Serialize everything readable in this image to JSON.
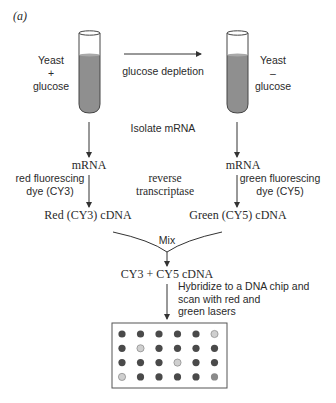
{
  "figure": {
    "panel_label": "(a)",
    "left_culture": {
      "line1": "Yeast",
      "line2": "+",
      "line3": "glucose"
    },
    "right_culture": {
      "line1": "Yeast",
      "line2": "–",
      "line3": "glucose"
    },
    "transition_label": "glucose depletion",
    "isolate_step": "Isolate mRNA",
    "left_mrna": "mRNA",
    "right_mrna": "mRNA",
    "left_dye": {
      "line1": "red fluorescing",
      "line2": "dye (CY3)"
    },
    "right_dye": {
      "line1": "green fluorescing",
      "line2": "dye (CY5)"
    },
    "enzyme": {
      "line1": "reverse",
      "line2": "transcriptase"
    },
    "left_cdna": "Red (CY3) cDNA",
    "right_cdna": "Green (CY5) cDNA",
    "mix_label": "Mix",
    "combined_cdna": "CY3 + CY5 cDNA",
    "hybridize": {
      "line1": "Hybridize to a DNA chip and",
      "line2": "scan with red and",
      "line3": "green lasers"
    },
    "chip": {
      "rows": 4,
      "cols": 6,
      "spots": [
        [
          "dark",
          "dark",
          "dark",
          "dark",
          "dark",
          "light"
        ],
        [
          "dark",
          "light",
          "dark",
          "dark",
          "dark",
          "dark"
        ],
        [
          "dark",
          "dark",
          "dark",
          "light",
          "dark",
          "dark"
        ],
        [
          "light",
          "dark",
          "dark",
          "dark",
          "dark",
          "medium"
        ]
      ],
      "colors": {
        "dark": "#4a4a4a",
        "light": "#cfcfcf",
        "medium": "#8a8a8a"
      }
    },
    "colors": {
      "tube_liquid": "#8f8f8f",
      "line": "#333333",
      "text": "#2a2a2a"
    }
  }
}
